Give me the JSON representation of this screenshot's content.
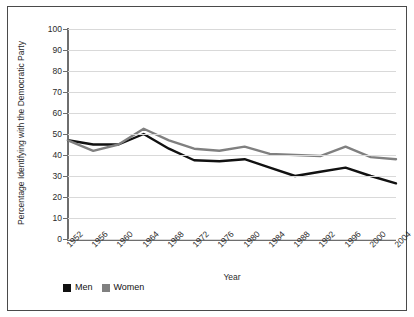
{
  "chart_data": {
    "type": "line",
    "title": "",
    "xlabel": "Year",
    "ylabel": "Percentage Identifying with the Democratic Party",
    "categories": [
      "1952",
      "1956",
      "1960",
      "1964",
      "1968",
      "1972",
      "1976",
      "1980",
      "1984",
      "1988",
      "1992",
      "1996",
      "2000",
      "2004"
    ],
    "x": [
      1952,
      1956,
      1960,
      1964,
      1968,
      1972,
      1976,
      1980,
      1984,
      1988,
      1992,
      1996,
      2000,
      2004
    ],
    "xlim": [
      1952,
      2004
    ],
    "ylim": [
      0,
      100
    ],
    "yticks": [
      0,
      10,
      20,
      30,
      40,
      50,
      60,
      70,
      80,
      90,
      100
    ],
    "grid": "horizontal",
    "legend_position": "bottom-left",
    "series": [
      {
        "name": "Men",
        "color": "#111111",
        "values": [
          47,
          45,
          45,
          50,
          43,
          37.5,
          37,
          38,
          34,
          30,
          32,
          34,
          30,
          26.5
        ]
      },
      {
        "name": "Women",
        "color": "#808080",
        "values": [
          47,
          42,
          45,
          52.5,
          47,
          43,
          42,
          44,
          40.5,
          40,
          39.5,
          44,
          39,
          38
        ]
      }
    ]
  },
  "legend": {
    "items": [
      {
        "label": "Men",
        "color": "#111111"
      },
      {
        "label": "Women",
        "color": "#808080"
      }
    ]
  },
  "axes": {
    "y_title": "Percentage Identifying with the Democratic Party",
    "x_title": "Year",
    "y_tick_labels": [
      "100",
      "90",
      "80",
      "70",
      "60",
      "50",
      "40",
      "30",
      "20",
      "10",
      "0"
    ],
    "x_tick_labels": [
      "1952",
      "1956",
      "1960",
      "1964",
      "1968",
      "1972",
      "1976",
      "1980",
      "1984",
      "1988",
      "1992",
      "1996",
      "2000",
      "2004"
    ]
  },
  "colors": {
    "men_line": "#111111",
    "women_line": "#808080",
    "gridline": "#d9d9d9",
    "axis": "#6e6e6e",
    "border": "#4a4a4a",
    "background": "#ffffff"
  }
}
